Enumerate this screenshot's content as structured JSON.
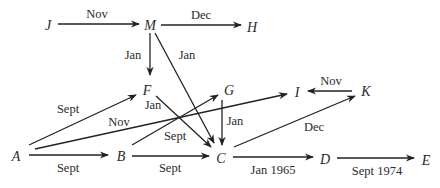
{
  "diagram": {
    "type": "directed-graph",
    "nodes": [
      {
        "id": "J",
        "label": "J",
        "x": 48,
        "y": 25
      },
      {
        "id": "M",
        "label": "M",
        "x": 150,
        "y": 25
      },
      {
        "id": "H",
        "label": "H",
        "x": 252,
        "y": 27
      },
      {
        "id": "F",
        "label": "F",
        "x": 147,
        "y": 90
      },
      {
        "id": "G",
        "label": "G",
        "x": 229,
        "y": 90
      },
      {
        "id": "I",
        "label": "I",
        "x": 297,
        "y": 92
      },
      {
        "id": "K",
        "label": "K",
        "x": 366,
        "y": 91
      },
      {
        "id": "A",
        "label": "A",
        "x": 16,
        "y": 156
      },
      {
        "id": "B",
        "label": "B",
        "x": 121,
        "y": 156
      },
      {
        "id": "C",
        "label": "C",
        "x": 221,
        "y": 158
      },
      {
        "id": "D",
        "label": "D",
        "x": 325,
        "y": 159
      },
      {
        "id": "E",
        "label": "E",
        "x": 426,
        "y": 160
      }
    ],
    "edges": [
      {
        "from": "J",
        "to": "M",
        "label": "Nov",
        "x1": 58,
        "y1": 24,
        "x2": 139,
        "y2": 24,
        "lx": 97,
        "ly": 18
      },
      {
        "from": "M",
        "to": "H",
        "label": "Dec",
        "x1": 161,
        "y1": 25,
        "x2": 241,
        "y2": 25,
        "lx": 201,
        "ly": 19
      },
      {
        "from": "M",
        "to": "F",
        "label": "Jan",
        "x1": 150,
        "y1": 33,
        "x2": 150,
        "y2": 75,
        "lx": 133,
        "ly": 59
      },
      {
        "from": "M",
        "to": "C",
        "label": "Jan",
        "x1": 155,
        "y1": 33,
        "x2": 214,
        "y2": 143,
        "lx": 187,
        "ly": 59
      },
      {
        "from": "F",
        "to": "C",
        "label": "Jan",
        "x1": 156,
        "y1": 96,
        "x2": 211,
        "y2": 147,
        "lx": 153,
        "ly": 109
      },
      {
        "from": "A",
        "to": "F",
        "label": "Sept",
        "x1": 29,
        "y1": 145,
        "x2": 136,
        "y2": 95,
        "lx": 68,
        "ly": 113
      },
      {
        "from": "A",
        "to": "I",
        "label": "Nov",
        "x1": 35,
        "y1": 149,
        "x2": 287,
        "y2": 94,
        "lx": 119,
        "ly": 126
      },
      {
        "from": "A",
        "to": "B",
        "label": "Sept",
        "x1": 29,
        "y1": 155,
        "x2": 108,
        "y2": 155,
        "lx": 68,
        "ly": 172
      },
      {
        "from": "B",
        "to": "G",
        "label": "Sept",
        "x1": 132,
        "y1": 145,
        "x2": 218,
        "y2": 95,
        "lx": 175,
        "ly": 140
      },
      {
        "from": "B",
        "to": "C",
        "label": "Sept",
        "x1": 132,
        "y1": 156,
        "x2": 209,
        "y2": 156,
        "lx": 170,
        "ly": 172
      },
      {
        "from": "G",
        "to": "C",
        "label": "Jan",
        "x1": 222,
        "y1": 100,
        "x2": 222,
        "y2": 145,
        "lx": 235,
        "ly": 125
      },
      {
        "from": "C",
        "to": "K",
        "label": "Dec",
        "x1": 234,
        "y1": 147,
        "x2": 355,
        "y2": 96,
        "lx": 314,
        "ly": 131
      },
      {
        "from": "K",
        "to": "I",
        "label": "Nov",
        "x1": 352,
        "y1": 91,
        "x2": 308,
        "y2": 91,
        "lx": 331,
        "ly": 85
      },
      {
        "from": "C",
        "to": "D",
        "label": "Jan 1965",
        "x1": 233,
        "y1": 157,
        "x2": 313,
        "y2": 157,
        "lx": 273,
        "ly": 174
      },
      {
        "from": "D",
        "to": "E",
        "label": "Sept 1974",
        "x1": 337,
        "y1": 158,
        "x2": 414,
        "y2": 158,
        "lx": 377,
        "ly": 175
      }
    ]
  }
}
